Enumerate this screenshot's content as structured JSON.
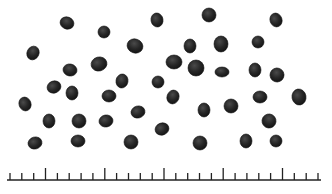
{
  "image": {
    "subject": "seeds on white background with scale ruler",
    "background_color": "#ffffff",
    "seed_color": "#2a2a2a",
    "seed_edge_color": "#111111"
  },
  "seeds": [
    {
      "x": 67,
      "y": 23,
      "rx": 7,
      "ry": 6,
      "rot": 20
    },
    {
      "x": 104,
      "y": 32,
      "rx": 6,
      "ry": 6,
      "rot": 0
    },
    {
      "x": 157,
      "y": 20,
      "rx": 6,
      "ry": 7,
      "rot": -10
    },
    {
      "x": 209,
      "y": 15,
      "rx": 7,
      "ry": 7,
      "rot": 0
    },
    {
      "x": 276,
      "y": 20,
      "rx": 6,
      "ry": 7,
      "rot": -20
    },
    {
      "x": 33,
      "y": 53,
      "rx": 6,
      "ry": 7,
      "rot": 25
    },
    {
      "x": 135,
      "y": 46,
      "rx": 8,
      "ry": 7,
      "rot": 20
    },
    {
      "x": 190,
      "y": 46,
      "rx": 6,
      "ry": 7,
      "rot": 0
    },
    {
      "x": 221,
      "y": 44,
      "rx": 7,
      "ry": 8,
      "rot": 0
    },
    {
      "x": 258,
      "y": 42,
      "rx": 6,
      "ry": 6,
      "rot": 0
    },
    {
      "x": 70,
      "y": 70,
      "rx": 7,
      "ry": 6,
      "rot": 10
    },
    {
      "x": 99,
      "y": 64,
      "rx": 8,
      "ry": 7,
      "rot": -15
    },
    {
      "x": 174,
      "y": 62,
      "rx": 8,
      "ry": 7,
      "rot": 0
    },
    {
      "x": 196,
      "y": 68,
      "rx": 8,
      "ry": 8,
      "rot": 0
    },
    {
      "x": 222,
      "y": 72,
      "rx": 7,
      "ry": 5,
      "rot": 0
    },
    {
      "x": 255,
      "y": 70,
      "rx": 6,
      "ry": 7,
      "rot": 0
    },
    {
      "x": 277,
      "y": 75,
      "rx": 7,
      "ry": 7,
      "rot": 20
    },
    {
      "x": 54,
      "y": 87,
      "rx": 7,
      "ry": 6,
      "rot": -20
    },
    {
      "x": 72,
      "y": 93,
      "rx": 6,
      "ry": 7,
      "rot": 0
    },
    {
      "x": 122,
      "y": 81,
      "rx": 6,
      "ry": 7,
      "rot": 10
    },
    {
      "x": 158,
      "y": 82,
      "rx": 6,
      "ry": 6,
      "rot": 0
    },
    {
      "x": 25,
      "y": 104,
      "rx": 6,
      "ry": 7,
      "rot": -20
    },
    {
      "x": 109,
      "y": 96,
      "rx": 7,
      "ry": 6,
      "rot": 0
    },
    {
      "x": 173,
      "y": 97,
      "rx": 6,
      "ry": 7,
      "rot": 20
    },
    {
      "x": 231,
      "y": 106,
      "rx": 7,
      "ry": 7,
      "rot": 0
    },
    {
      "x": 260,
      "y": 97,
      "rx": 7,
      "ry": 6,
      "rot": 0
    },
    {
      "x": 299,
      "y": 97,
      "rx": 7,
      "ry": 8,
      "rot": -10
    },
    {
      "x": 138,
      "y": 112,
      "rx": 7,
      "ry": 6,
      "rot": -15
    },
    {
      "x": 204,
      "y": 110,
      "rx": 6,
      "ry": 7,
      "rot": 0
    },
    {
      "x": 269,
      "y": 121,
      "rx": 7,
      "ry": 7,
      "rot": 30
    },
    {
      "x": 49,
      "y": 121,
      "rx": 6,
      "ry": 7,
      "rot": 0
    },
    {
      "x": 79,
      "y": 121,
      "rx": 7,
      "ry": 7,
      "rot": 0
    },
    {
      "x": 106,
      "y": 121,
      "rx": 7,
      "ry": 6,
      "rot": -10
    },
    {
      "x": 162,
      "y": 129,
      "rx": 7,
      "ry": 6,
      "rot": -20
    },
    {
      "x": 35,
      "y": 143,
      "rx": 7,
      "ry": 6,
      "rot": -15
    },
    {
      "x": 78,
      "y": 141,
      "rx": 7,
      "ry": 6,
      "rot": 0
    },
    {
      "x": 131,
      "y": 142,
      "rx": 7,
      "ry": 7,
      "rot": 0
    },
    {
      "x": 200,
      "y": 143,
      "rx": 7,
      "ry": 7,
      "rot": 0
    },
    {
      "x": 246,
      "y": 141,
      "rx": 6,
      "ry": 7,
      "rot": 0
    },
    {
      "x": 276,
      "y": 141,
      "rx": 6,
      "ry": 6,
      "rot": 0
    }
  ],
  "ruler": {
    "baseline_y": 180,
    "x_start": 7,
    "x_end": 321,
    "tick_count": 27,
    "minor_tick_height": 7,
    "major_tick_height": 12,
    "major_every": 5,
    "major_offset": 3,
    "color": "#222222"
  }
}
